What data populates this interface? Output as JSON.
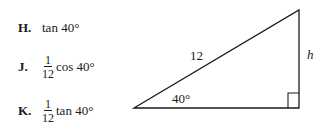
{
  "choices": [
    {
      "letter": "H.",
      "numerator": "",
      "denominator": "",
      "expr": "tan 40°"
    },
    {
      "letter": "J.",
      "numerator": "1",
      "denominator": "12",
      "expr": "cos 40°"
    },
    {
      "letter": "K.",
      "numerator": "1",
      "denominator": "12",
      "expr": "tan 40°"
    }
  ],
  "triangle": {
    "hypotenuse_label": "12",
    "angle_label": "40°",
    "side_label": "h"
  }
}
